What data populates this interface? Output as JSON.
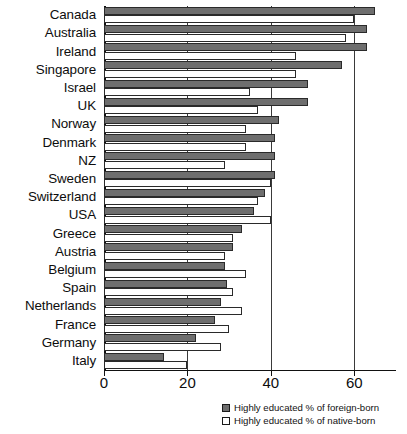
{
  "chart_data": {
    "type": "bar",
    "orientation": "horizontal",
    "title": "",
    "subtitle": "",
    "xlabel": "",
    "ylabel": "",
    "xlim": [
      0,
      70
    ],
    "xticks": [
      0,
      20,
      40,
      60
    ],
    "xticklabels": [
      "0",
      "20",
      "40",
      "60"
    ],
    "grid": true,
    "gridlines_at": [
      20,
      40,
      60
    ],
    "legend_position": "bottom-right",
    "categories": [
      "Canada",
      "Australia",
      "Ireland",
      "Singapore",
      "Israel",
      "UK",
      "Norway",
      "Denmark",
      "NZ",
      "Sweden",
      "Switzerland",
      "USA",
      "Greece",
      "Austria",
      "Belgium",
      "Spain",
      "Netherlands",
      "France",
      "Germany",
      "Italy"
    ],
    "series": [
      {
        "name": "Highly educated % of foreign-born",
        "color": "#6e6e6e",
        "values": [
          65,
          63,
          63,
          57,
          49,
          49,
          42,
          41,
          41,
          41,
          38.5,
          36,
          33,
          31,
          29,
          29.5,
          28,
          26.5,
          22,
          14.5
        ]
      },
      {
        "name": "Highly educated % of native-born",
        "color": "#ffffff",
        "values": [
          60,
          58,
          46,
          46,
          35,
          37,
          34,
          34,
          29,
          40,
          37,
          40,
          31,
          29,
          34,
          31,
          33,
          30,
          28,
          20
        ]
      }
    ]
  },
  "legend": {
    "items": [
      {
        "label": "Highly educated % of foreign-born",
        "swatch": "filled-gray-square"
      },
      {
        "label": "Highly educated % of native-born",
        "swatch": "outlined-white-square"
      }
    ]
  },
  "colors": {
    "foreign_born_fill": "#6e6e6e",
    "native_born_fill": "#ffffff",
    "bar_border": "#2a2a2a",
    "axis": "#111111",
    "gridline": "#3a3a3a",
    "background": "#ffffff"
  }
}
